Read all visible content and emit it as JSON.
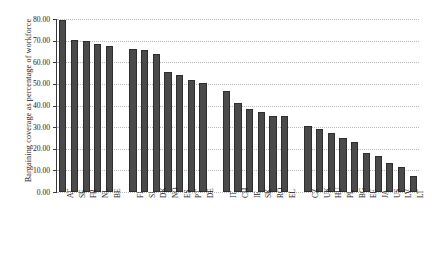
{
  "chart_data": {
    "type": "bar",
    "title": "",
    "xlabel": "",
    "ylabel": "Bargaining coverage as percentage of workforce",
    "ylim": [
      0,
      80
    ],
    "ytick_labels": [
      "80.00",
      "70.00",
      "60.00",
      "50.00",
      "40.00",
      "30.00",
      "20.00",
      "10.00",
      "0.00"
    ],
    "ytick_values": [
      80,
      70,
      60,
      50,
      40,
      30,
      20,
      10,
      0
    ],
    "grid": true,
    "legend": "none",
    "bar_color": "#4a4a4a",
    "categories": [
      "AT",
      "SE",
      "FR",
      "NL",
      "BE",
      "FI",
      "SI",
      "DK",
      "NO",
      "ES",
      "PT",
      "DE",
      "IT",
      "CH",
      "IE",
      "SK",
      "RO",
      "EL",
      "CZ",
      "UK",
      "HU",
      "PL",
      "BG",
      "EE",
      "JA",
      "US",
      "LV",
      "LT"
    ],
    "values": [
      79.5,
      70.3,
      70.0,
      68.5,
      67.5,
      66.0,
      65.5,
      63.8,
      55.5,
      54.3,
      52.0,
      50.6,
      46.5,
      41.0,
      38.5,
      37.0,
      35.2,
      35.0,
      30.5,
      29.0,
      27.5,
      25.0,
      23.0,
      18.0,
      16.5,
      13.5,
      11.5,
      7.5
    ],
    "group_breaks_after": [
      "BE",
      "DE",
      "EL"
    ]
  }
}
